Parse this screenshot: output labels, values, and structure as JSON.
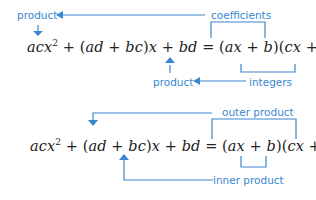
{
  "accent_color": "#3a87cf",
  "text_color": "#222222",
  "diagram1": {
    "equation": {
      "lhs_term1": "acx",
      "lhs_term1_exp": "2",
      "lhs_op1": " + (",
      "lhs_ad": "ad",
      "lhs_op2": " + ",
      "lhs_bc": "bc",
      "lhs_op3": ")",
      "lhs_x": "x",
      "lhs_op4": " + ",
      "lhs_bd": "bd",
      "equals": " = (",
      "rhs_ax": "ax",
      "rhs_op1": " + ",
      "rhs_b": "b",
      "rhs_mid": ")(",
      "rhs_cx": "cx",
      "rhs_op2": " + ",
      "rhs_d": "d",
      "rhs_close": ")"
    },
    "labels": {
      "product_top": "product",
      "coefficients": "coefficients",
      "product_bottom": "product",
      "integers": "integers"
    }
  },
  "diagram2": {
    "equation": {
      "lhs_term1": "acx",
      "lhs_term1_exp": "2",
      "lhs_op1": " + (",
      "lhs_ad": "ad",
      "lhs_op2": " + ",
      "lhs_bc": "bc",
      "lhs_op3": ")",
      "lhs_x": "x",
      "lhs_op4": " + ",
      "lhs_bd": "bd",
      "equals": " = (",
      "rhs_ax": "ax",
      "rhs_op1": " + ",
      "rhs_b": "b",
      "rhs_mid": ")(",
      "rhs_cx": "cx",
      "rhs_op2": " + ",
      "rhs_d": "d",
      "rhs_close": ")"
    },
    "labels": {
      "outer_product": "outer product",
      "inner_product": "inner product"
    }
  }
}
